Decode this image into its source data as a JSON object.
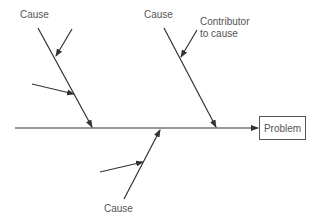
{
  "diagram": {
    "type": "fishbone (Ishikawa) cause-and-effect diagram",
    "problem_label": "Problem",
    "labels": {
      "cause_top_left": "Cause",
      "cause_top_right": "Cause",
      "cause_bottom": "Cause",
      "contributor_line1": "Contributor",
      "contributor_line2": "to cause"
    },
    "colors": {
      "line": "#333333",
      "text": "#555555",
      "box_border": "#555555"
    }
  }
}
